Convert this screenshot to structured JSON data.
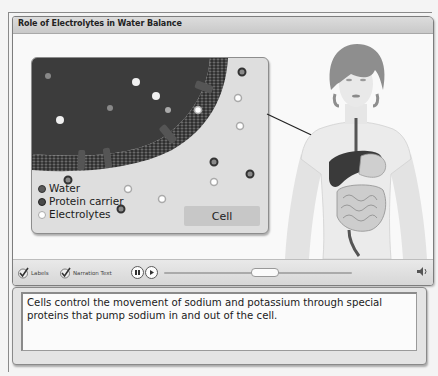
{
  "window": {
    "title": "Role of Electrolytes in Water Balance"
  },
  "cell_panel": {
    "legend": [
      {
        "label": "Water",
        "kind": "water"
      },
      {
        "label": "Protein carrier",
        "kind": "protein"
      },
      {
        "label": "Electrolytes",
        "kind": "electrolytes"
      }
    ],
    "button_label": "Cell"
  },
  "controls": {
    "labels_toggle": "Labels",
    "narration_toggle": "Narration Text",
    "pause_icon": "pause-icon",
    "play_icon": "play-icon",
    "volume_icon": "speaker-icon"
  },
  "narration": {
    "text": "Cells control the movement of sodium and potassium through special proteins that pump sodium in and out of the cell."
  },
  "colors": {
    "frame_border": "#7d7d7d",
    "title_bar": "#d2d2d2",
    "cell_interior": "#3a3a3a",
    "panel_bg": "#dedede"
  }
}
